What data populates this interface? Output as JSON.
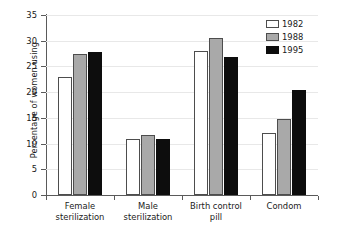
{
  "chart_data": {
    "type": "bar",
    "title": "",
    "xlabel": "",
    "ylabel": "Percentage of women using",
    "categories": [
      "Female sterilization",
      "Male sterilization",
      "Birth control pill",
      "Condom"
    ],
    "category_lines": [
      [
        "Female",
        "sterilization"
      ],
      [
        "Male",
        "sterilization"
      ],
      [
        "Birth control",
        "pill"
      ],
      [
        "Condom",
        ""
      ]
    ],
    "series": [
      {
        "name": "1982",
        "color": "#ffffff",
        "values": [
          23.0,
          10.8,
          28.0,
          12.0
        ]
      },
      {
        "name": "1988",
        "color": "#a9a9a9",
        "values": [
          27.5,
          11.6,
          30.6,
          14.7
        ]
      },
      {
        "name": "1995",
        "color": "#0d0d0d",
        "values": [
          27.8,
          10.9,
          26.9,
          20.5
        ]
      }
    ],
    "ylim": [
      0,
      35
    ],
    "yticks": [
      0,
      5,
      10,
      15,
      20,
      25,
      30,
      35
    ],
    "ytick_labels": [
      "0",
      "5",
      "10",
      "15",
      "20",
      "25",
      "30",
      "35"
    ],
    "grid": true,
    "legend_position": "top-right",
    "legend_entries": [
      "1982",
      "1988",
      "1995"
    ]
  }
}
